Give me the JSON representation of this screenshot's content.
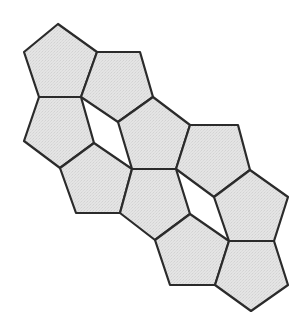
{
  "diagram": {
    "style": {
      "background": "#ffffff",
      "fill": "#e2e2e2",
      "stroke": "#2b2b2b",
      "stroke_width": 2.2
    },
    "pentagons": [
      {
        "id": "p1",
        "points": [
          [
            58,
            24
          ],
          [
            97,
            52
          ],
          [
            81,
            97
          ],
          [
            39,
            97
          ],
          [
            24,
            52
          ]
        ]
      },
      {
        "id": "p2",
        "points": [
          [
            97,
            52
          ],
          [
            140,
            52
          ],
          [
            153,
            97
          ],
          [
            118,
            122
          ],
          [
            81,
            97
          ]
        ]
      },
      {
        "id": "p3",
        "points": [
          [
            153,
            97
          ],
          [
            190,
            125
          ],
          [
            176,
            169
          ],
          [
            132,
            169
          ],
          [
            118,
            122
          ]
        ]
      },
      {
        "id": "p4",
        "points": [
          [
            190,
            125
          ],
          [
            238,
            125
          ],
          [
            250,
            170
          ],
          [
            214,
            197
          ],
          [
            176,
            169
          ]
        ]
      },
      {
        "id": "p5",
        "points": [
          [
            250,
            170
          ],
          [
            288,
            197
          ],
          [
            274,
            241
          ],
          [
            229,
            241
          ],
          [
            214,
            197
          ]
        ]
      },
      {
        "id": "p6",
        "points": [
          [
            39,
            97
          ],
          [
            81,
            97
          ],
          [
            94,
            143
          ],
          [
            60,
            168
          ],
          [
            24,
            141
          ]
        ]
      },
      {
        "id": "p7",
        "points": [
          [
            94,
            143
          ],
          [
            132,
            169
          ],
          [
            120,
            213
          ],
          [
            76,
            213
          ],
          [
            60,
            168
          ]
        ]
      },
      {
        "id": "p8",
        "points": [
          [
            132,
            169
          ],
          [
            176,
            169
          ],
          [
            190,
            214
          ],
          [
            155,
            240
          ],
          [
            120,
            213
          ]
        ]
      },
      {
        "id": "p9",
        "points": [
          [
            190,
            214
          ],
          [
            229,
            241
          ],
          [
            215,
            285
          ],
          [
            170,
            285
          ],
          [
            155,
            240
          ]
        ]
      },
      {
        "id": "p10",
        "points": [
          [
            229,
            241
          ],
          [
            274,
            241
          ],
          [
            288,
            285
          ],
          [
            251,
            311
          ],
          [
            215,
            285
          ]
        ]
      }
    ]
  }
}
